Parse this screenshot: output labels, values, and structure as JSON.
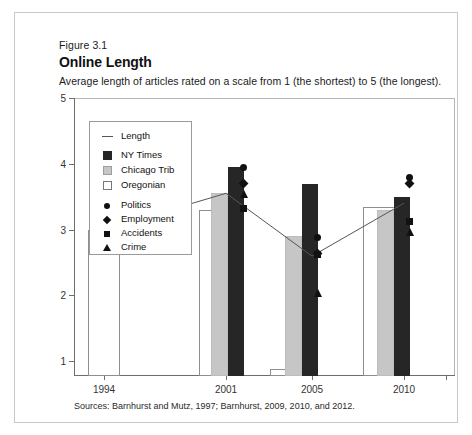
{
  "figure": {
    "number": "Figure 3.1",
    "title": "Online Length",
    "subtitle": "Average length of articles rated on a scale from 1 (the shortest) to 5 (the longest).",
    "source": "Sources: Barnhurst and Mutz, 1997; Barnhurst, 2009, 2010, and 2012."
  },
  "legend": {
    "items": [
      {
        "label": "Length",
        "key": "line-swatch"
      },
      {
        "label": "NY Times",
        "key": "black-square-swatch"
      },
      {
        "label": "Chicago Trib",
        "key": "gray-square-swatch"
      },
      {
        "label": "Oregonian",
        "key": "white-square-swatch"
      },
      {
        "label": "Politics",
        "key": "circle-marker"
      },
      {
        "label": "Employment",
        "key": "diamond-marker"
      },
      {
        "label": "Accidents",
        "key": "square-marker"
      },
      {
        "label": "Crime",
        "key": "triangle-marker"
      }
    ]
  },
  "colors": {
    "ny_times": "#262626",
    "chicago_trib": "#c6c6c6",
    "oregonian": "#ffffff",
    "marker": "#111111",
    "line": "#555555",
    "axis": "#6e6e6e",
    "card_border": "#c9c9c9"
  },
  "chart_data": {
    "type": "bar",
    "title": "Online Length",
    "subtitle": "Average length of articles rated on a scale from 1 (the shortest) to 5 (the longest).",
    "xlabel": "",
    "ylabel": "",
    "categories": [
      "1994",
      "2001",
      "2005",
      "2010"
    ],
    "ylim": [
      1,
      5
    ],
    "yticks": [
      1,
      2,
      3,
      4,
      5
    ],
    "ytick_labels": [
      "1",
      "2",
      "3",
      "4",
      "5"
    ],
    "grid": false,
    "legend_position": "inside-upper-left",
    "series": [
      {
        "name": "Oregonian",
        "type": "bar",
        "values": [
          null,
          3.3,
          1.1,
          3.35
        ]
      },
      {
        "name": "Chicago Trib",
        "type": "bar",
        "values": [
          null,
          3.55,
          2.9,
          3.3
        ]
      },
      {
        "name": "NY Times",
        "type": "bar",
        "values": [
          null,
          4.2,
          3.7,
          3.5
        ]
      },
      {
        "name": "Length",
        "type": "line",
        "values": [
          3.0,
          3.55,
          2.6,
          3.4
        ]
      }
    ],
    "markers": [
      {
        "name": "Politics",
        "shape": "circle",
        "values": [
          null,
          3.95,
          2.9,
          3.8
        ]
      },
      {
        "name": "Employment",
        "shape": "diamond",
        "values": [
          null,
          3.7,
          2.65,
          3.7
        ]
      },
      {
        "name": "Accidents",
        "shape": "square",
        "values": [
          null,
          3.33,
          2.63,
          3.12
        ]
      },
      {
        "name": "Crime",
        "shape": "triangle",
        "values": [
          null,
          3.55,
          2.05,
          2.98
        ]
      }
    ]
  },
  "axis": {
    "y_labels": [
      "5",
      "4",
      "3",
      "2",
      "1"
    ],
    "x_labels": [
      "1994",
      "2001",
      "2005",
      "2010"
    ]
  }
}
